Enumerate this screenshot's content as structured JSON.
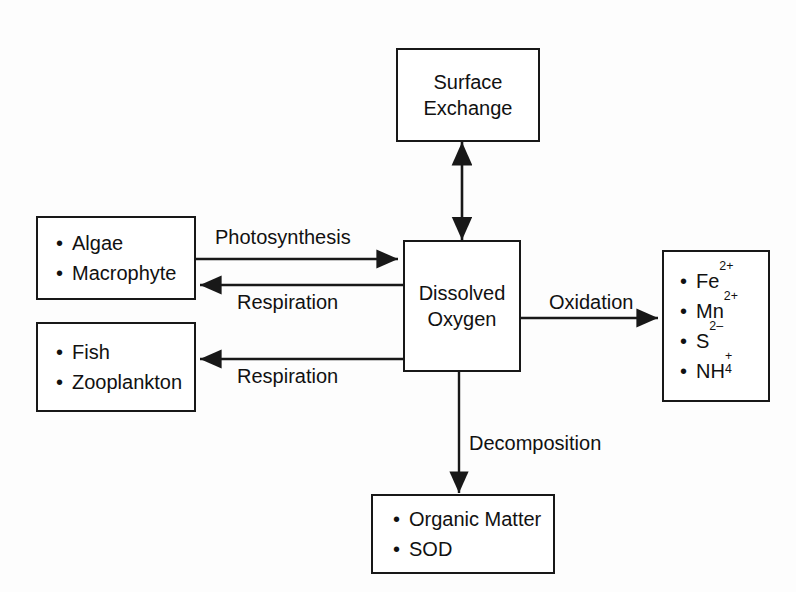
{
  "diagram": {
    "line_color": "#181818",
    "text_color": "#111111",
    "background": "#fdfdfd",
    "nodes": {
      "surface_exchange": {
        "lines": [
          "Surface",
          "Exchange"
        ]
      },
      "dissolved_oxygen": {
        "lines": [
          "Dissolved",
          "Oxygen"
        ]
      },
      "primary_producers": {
        "items": [
          "Algae",
          "Macrophyte"
        ]
      },
      "consumers": {
        "items": [
          "Fish",
          "Zooplankton"
        ]
      },
      "reduced_species": {
        "items": [
          {
            "base": "Fe",
            "charge": "2+",
            "index": ""
          },
          {
            "base": "Mn",
            "charge": "2+",
            "index": ""
          },
          {
            "base": "S",
            "charge": "2–",
            "index": ""
          },
          {
            "base": "NH",
            "charge": "+",
            "index": "4"
          }
        ]
      },
      "sediment_demand": {
        "items": [
          "Organic Matter",
          "SOD"
        ]
      }
    },
    "edges": [
      {
        "name": "surface-exchange-flux",
        "label": "",
        "direction": "bidirectional"
      },
      {
        "name": "photosynthesis-flux",
        "label": "Photosynthesis",
        "direction": "producers-to-oxygen"
      },
      {
        "name": "plant-respiration-flux",
        "label": "Respiration",
        "direction": "oxygen-to-producers"
      },
      {
        "name": "animal-respiration-flux",
        "label": "Respiration",
        "direction": "oxygen-to-consumers"
      },
      {
        "name": "oxidation-flux",
        "label": "Oxidation",
        "direction": "oxygen-to-reduced-species"
      },
      {
        "name": "decomposition-flux",
        "label": "Decomposition",
        "direction": "oxygen-to-sediment"
      }
    ],
    "bullet_glyph": "•"
  }
}
